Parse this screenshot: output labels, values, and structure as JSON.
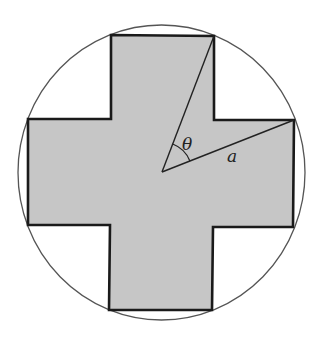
{
  "diagram": {
    "labels": {
      "angle": "θ",
      "radius": "a"
    },
    "colors": {
      "background": "#ffffff",
      "cross_fill": "#c6c6c6",
      "cross_stroke": "#1a1a1a",
      "circle_stroke": "#555555",
      "line_stroke": "#222222"
    }
  }
}
